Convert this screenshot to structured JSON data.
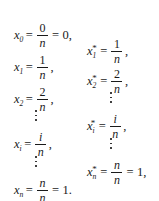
{
  "document": {
    "type": "math-formula",
    "description": "Partition points and sample points of a uniform partition of [0,1]",
    "background_color": "#ffffff",
    "text_color": "#1a1a1a"
  },
  "left_column": {
    "rows": [
      {
        "kind": "equation",
        "variable": "x",
        "subscript": "0",
        "starred": false,
        "relation": "=",
        "numerator": "0",
        "denominator": "n",
        "relation2": "=",
        "result": "0,"
      },
      {
        "kind": "equation",
        "variable": "x",
        "subscript": "1",
        "starred": false,
        "relation": "=",
        "numerator": "1",
        "denominator": "n",
        "relation2": "",
        "result": ","
      },
      {
        "kind": "equation",
        "variable": "x",
        "subscript": "2",
        "starred": false,
        "relation": "=",
        "numerator": "2",
        "denominator": "n",
        "relation2": "",
        "result": ","
      },
      {
        "kind": "vdots"
      },
      {
        "kind": "equation",
        "variable": "x",
        "subscript": "i",
        "starred": false,
        "relation": "=",
        "numerator": "i",
        "denominator": "n",
        "relation2": "",
        "result": ","
      },
      {
        "kind": "vdots"
      },
      {
        "kind": "equation",
        "variable": "x",
        "subscript": "n",
        "starred": false,
        "relation": "=",
        "numerator": "n",
        "denominator": "n",
        "relation2": "=",
        "result": "1."
      }
    ]
  },
  "right_column": {
    "rows": [
      {
        "kind": "equation",
        "variable": "x",
        "subscript": "1",
        "starred": true,
        "star": "*",
        "relation": "=",
        "numerator": "1",
        "denominator": "n",
        "relation2": "",
        "result": ","
      },
      {
        "kind": "equation",
        "variable": "x",
        "subscript": "2",
        "starred": true,
        "star": "*",
        "relation": "=",
        "numerator": "2",
        "denominator": "n",
        "relation2": "",
        "result": ","
      },
      {
        "kind": "vdots"
      },
      {
        "kind": "equation",
        "variable": "x",
        "subscript": "i",
        "starred": true,
        "star": "*",
        "relation": "=",
        "numerator": "i",
        "denominator": "n",
        "relation2": "",
        "result": ","
      },
      {
        "kind": "vdots"
      },
      {
        "kind": "equation",
        "variable": "x",
        "subscript": "n",
        "starred": true,
        "star": "*",
        "relation": "=",
        "numerator": "n",
        "denominator": "n",
        "relation2": "=",
        "result": "1,"
      }
    ]
  }
}
